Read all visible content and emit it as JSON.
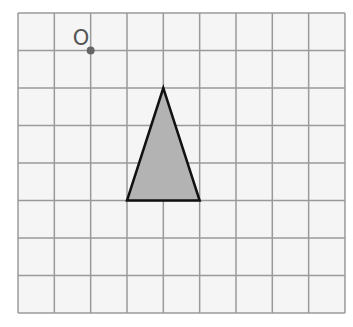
{
  "diagram": {
    "type": "grid-with-shape",
    "background": "#ffffff",
    "grid": {
      "columns": 9,
      "rows": 8,
      "x0": 18,
      "y0": 13,
      "cell_width": 36.33,
      "cell_height": 37.5,
      "fill": "#f5f5f5",
      "line_color": "#9a9a9a",
      "line_width": 1.5
    },
    "point": {
      "label": "O",
      "grid_col": 2,
      "grid_row": 1,
      "color": "#666666",
      "radius": 4,
      "label_color": "#555555"
    },
    "triangle": {
      "vertices_grid": [
        [
          4,
          2
        ],
        [
          3,
          5
        ],
        [
          5,
          5
        ]
      ],
      "fill": "#b3b3b3",
      "stroke": "#111111",
      "stroke_width": 2.5
    }
  }
}
